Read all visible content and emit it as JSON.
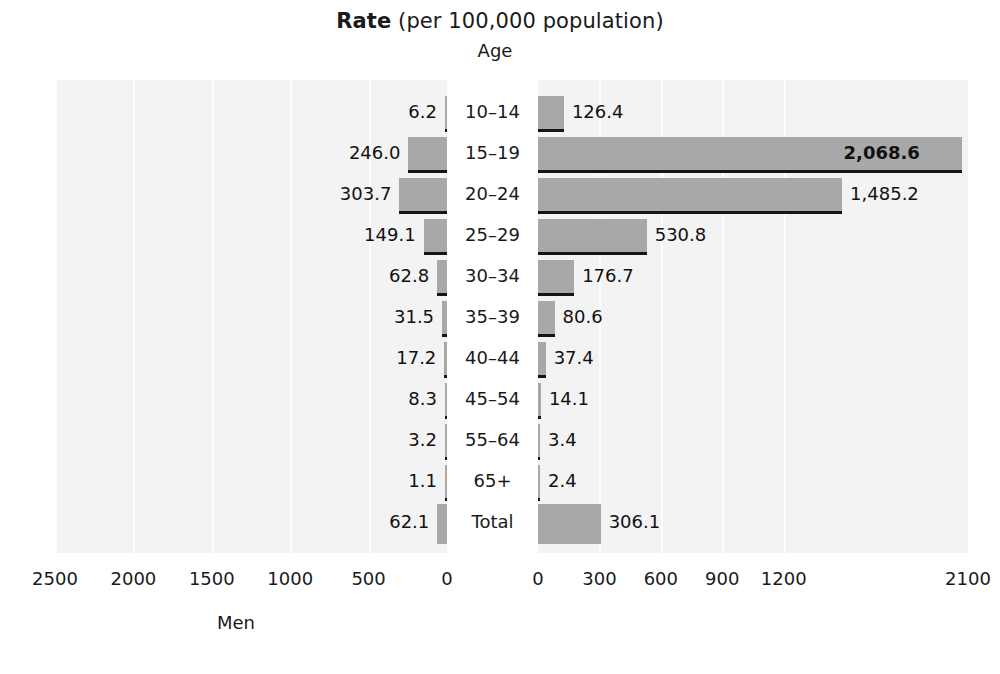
{
  "title": {
    "strong": "Rate",
    "light": " (per 100,000 population)"
  },
  "age_header": "Age",
  "axes": {
    "left_title": "Men",
    "right_title": "",
    "left_ticks": [
      "2500",
      "2000",
      "1500",
      "1000",
      "500",
      "0"
    ],
    "right_ticks": [
      "0",
      "300",
      "600",
      "900",
      "1200",
      "2100"
    ]
  },
  "colors": {
    "bar": "#a8a8a8",
    "panel": "#f3f3f3",
    "gridline": "#ffffff",
    "separator": "#151515",
    "text": "#1a1a1a"
  },
  "chart_data": {
    "type": "bar",
    "title": "Rate (per 100,000 population)",
    "subtitle": "Age",
    "orientation": "horizontal-pyramid",
    "categories": [
      "10–14",
      "15–19",
      "20–24",
      "25–29",
      "30–34",
      "35–39",
      "40–44",
      "45–54",
      "55–64",
      "65+",
      "Total"
    ],
    "series": [
      {
        "name": "Men",
        "side": "left",
        "values": [
          6.2,
          246.0,
          303.7,
          149.1,
          62.8,
          31.5,
          17.2,
          8.3,
          3.2,
          1.1,
          62.1
        ],
        "labels": [
          "6.2",
          "246.0",
          "303.7",
          "149.1",
          "62.8",
          "31.5",
          "17.2",
          "8.3",
          "3.2",
          "1.1",
          "62.1"
        ]
      },
      {
        "name": "Women",
        "side": "right",
        "values": [
          126.4,
          2068.6,
          1485.2,
          530.8,
          176.7,
          80.6,
          37.4,
          14.1,
          3.4,
          2.4,
          306.1
        ],
        "labels": [
          "126.4",
          "2,068.6",
          "1,485.2",
          "530.8",
          "176.7",
          "80.6",
          "37.4",
          "14.1",
          "3.4",
          "2.4",
          "306.1"
        ]
      }
    ],
    "xlabel": "",
    "ylabel": "Age",
    "left_axis_ticks": [
      2500,
      2000,
      1500,
      1000,
      500,
      0
    ],
    "right_axis_ticks": [
      0,
      300,
      600,
      900,
      1200,
      2100
    ],
    "left_xlim": [
      0,
      2500
    ],
    "right_xlim": [
      0,
      2100
    ],
    "grid": true,
    "legend": "none"
  }
}
